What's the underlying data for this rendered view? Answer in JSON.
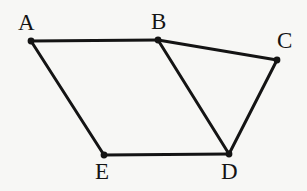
{
  "figure": {
    "type": "polygon-diagram",
    "canvas": {
      "width": 307,
      "height": 191
    },
    "background_color": "#f7f7f5",
    "stroke_color": "#141414",
    "stroke_width": 3,
    "vertex_dot_radius": 3.4,
    "vertices": [
      {
        "id": "A",
        "label": "A",
        "x": 31,
        "y": 41,
        "label_x": 18,
        "label_y": 11
      },
      {
        "id": "B",
        "label": "B",
        "x": 158,
        "y": 40,
        "label_x": 151,
        "label_y": 10
      },
      {
        "id": "C",
        "label": "C",
        "x": 277,
        "y": 60,
        "label_x": 277,
        "label_y": 29
      },
      {
        "id": "D",
        "label": "D",
        "x": 229,
        "y": 154,
        "label_x": 221,
        "label_y": 160
      },
      {
        "id": "E",
        "label": "E",
        "x": 104,
        "y": 155,
        "label_x": 95,
        "label_y": 160
      }
    ],
    "edges": [
      {
        "id": "AB",
        "from": "A",
        "to": "B",
        "kind": "side"
      },
      {
        "id": "BC",
        "from": "B",
        "to": "C",
        "kind": "side"
      },
      {
        "id": "CD",
        "from": "C",
        "to": "D",
        "kind": "side"
      },
      {
        "id": "DE",
        "from": "D",
        "to": "E",
        "kind": "side"
      },
      {
        "id": "EA",
        "from": "E",
        "to": "A",
        "kind": "side"
      },
      {
        "id": "BD",
        "from": "B",
        "to": "D",
        "kind": "diagonal"
      }
    ]
  }
}
